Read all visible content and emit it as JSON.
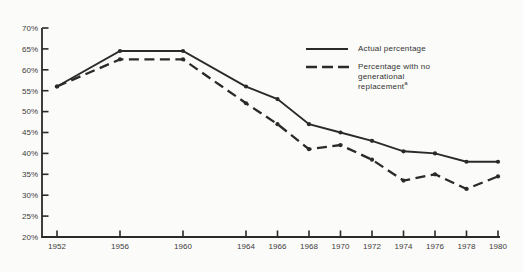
{
  "colors": {
    "background": "#fbfbf9",
    "ink": "#2a2a2a",
    "text": "#3b3b3b"
  },
  "chart_data": {
    "type": "line",
    "x": [
      1952,
      1956,
      1960,
      1964,
      1966,
      1968,
      1970,
      1972,
      1974,
      1976,
      1978,
      1980
    ],
    "xtick_labels": [
      "1952",
      "1956",
      "1960",
      "1964",
      "1966",
      "1968",
      "1970",
      "1972",
      "1974",
      "1976",
      "1978",
      "1980"
    ],
    "xlim": [
      1951,
      1981
    ],
    "ylim": [
      20,
      70
    ],
    "ytick_values": [
      70,
      65,
      60,
      55,
      50,
      45,
      40,
      35,
      30,
      25,
      20
    ],
    "ytick_labels": [
      "70%",
      "65%",
      "60%",
      "55%",
      "50%",
      "45%",
      "40%",
      "35%",
      "30%",
      "25%",
      "20%"
    ],
    "grid": false,
    "legend_position": "upper-right",
    "series": [
      {
        "name": "Actual percentage",
        "line_style": "solid",
        "color": "#2a2a2a",
        "values": [
          56,
          64.5,
          64.5,
          56,
          53,
          47,
          45,
          43,
          40.5,
          40,
          38,
          38
        ]
      },
      {
        "name": "Percentage with no generational replacement",
        "footnote_marker": "a",
        "line_style": "dashed",
        "color": "#2a2a2a",
        "values": [
          56,
          62.5,
          62.5,
          52,
          47,
          41,
          42,
          38.5,
          33.5,
          35,
          31.5,
          34.5
        ]
      }
    ]
  }
}
